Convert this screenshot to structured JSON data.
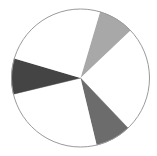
{
  "chart_data": {
    "type": "pie",
    "title": "",
    "legend": [],
    "start_angle_deg": -73.5,
    "direction": "clockwise",
    "slices": [
      {
        "label": "",
        "value": 8.33,
        "color": "#a8a8a8"
      },
      {
        "label": "",
        "value": 25.0,
        "color": "#ffffff"
      },
      {
        "label": "",
        "value": 8.33,
        "color": "#6c6c6c"
      },
      {
        "label": "",
        "value": 25.0,
        "color": "#ffffff"
      },
      {
        "label": "",
        "value": 8.34,
        "color": "#444444"
      },
      {
        "label": "",
        "value": 25.0,
        "color": "#ffffff"
      }
    ],
    "outline_color": "#9a9a9a",
    "center": [
      80.5,
      78
    ],
    "radius": 69
  }
}
